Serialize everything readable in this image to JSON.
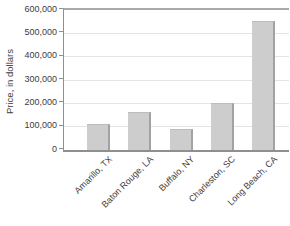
{
  "window": {
    "width": 290,
    "height": 226,
    "background": "#ffffff"
  },
  "chart_data": {
    "type": "bar",
    "title": "",
    "xlabel": "",
    "ylabel": "Price, in dollars",
    "categories": [
      "Amarillo, TX",
      "Baton Rouge, LA",
      "Buffalo, NY",
      "Charleston, SC",
      "Long Beach, CA"
    ],
    "values": [
      110000,
      165000,
      90000,
      200000,
      555000
    ],
    "ylim": [
      0,
      600000
    ],
    "ytick_step": 100000,
    "ytick_labels": [
      "0",
      "100,000",
      "200,000",
      "300,000",
      "400,000",
      "500,000",
      "600,000"
    ],
    "grid": "horizontal",
    "legend": "none"
  },
  "colors": {
    "bar_fill": "#cdcdcd",
    "bar_edge": "#a2a2a2",
    "gridline": "#e4e4e4",
    "axis": "#8f8f8f",
    "text": "#3d3d3d",
    "background": "#ffffff"
  }
}
